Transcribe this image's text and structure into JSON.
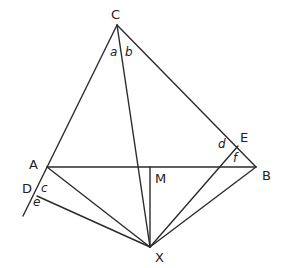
{
  "diagram": {
    "points": {
      "C": {
        "label": "C",
        "x": 117,
        "y": 25
      },
      "A": {
        "label": "A",
        "x": 47,
        "y": 167
      },
      "B": {
        "label": "B",
        "x": 256,
        "y": 167
      },
      "M": {
        "label": "M",
        "x": 150,
        "y": 167
      },
      "X": {
        "label": "X",
        "x": 150,
        "y": 247
      },
      "D": {
        "label": "D",
        "x": 37,
        "y": 196
      },
      "E": {
        "label": "E",
        "x": 238,
        "y": 146
      }
    },
    "angles": {
      "a": "a",
      "b": "b",
      "c": "c",
      "d": "d",
      "e": "e",
      "f": "f"
    },
    "segments": [
      "C-A extended to D",
      "C-B",
      "A-B",
      "C-X",
      "M-X",
      "A-X",
      "D-X",
      "E-X",
      "B-X"
    ]
  }
}
